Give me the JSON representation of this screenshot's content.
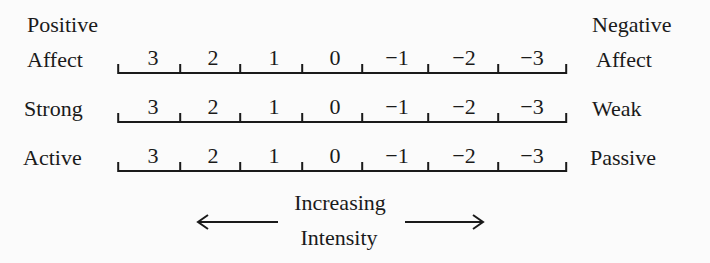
{
  "diagram": {
    "rows": [
      {
        "left_label_lines": [
          "Positive",
          "Affect"
        ],
        "right_label_lines": [
          "Negative",
          "Affect"
        ],
        "values": [
          "3",
          "2",
          "1",
          "0",
          "−1",
          "−2",
          "−3"
        ]
      },
      {
        "left_label_lines": [
          "Strong"
        ],
        "right_label_lines": [
          "Weak"
        ],
        "values": [
          "3",
          "2",
          "1",
          "0",
          "−1",
          "−2",
          "−3"
        ]
      },
      {
        "left_label_lines": [
          "Active"
        ],
        "right_label_lines": [
          "Passive"
        ],
        "values": [
          "3",
          "2",
          "1",
          "0",
          "−1",
          "−2",
          "−3"
        ]
      }
    ],
    "intensity": {
      "line1": "Increasing",
      "line2": "Intensity",
      "left_arrow_icon": "arrow-left-icon",
      "right_arrow_icon": "arrow-right-icon"
    },
    "colors": {
      "ink": "#1a1a1a",
      "background": "#fbfbfb"
    }
  }
}
